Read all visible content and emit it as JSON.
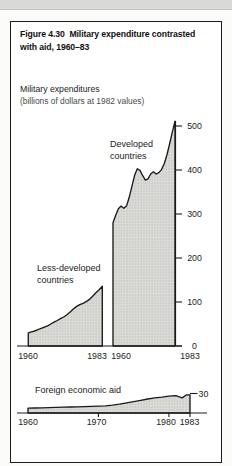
{
  "figure": {
    "title_lines": [
      "Figure 4.30  Military expenditure contrasted",
      "with aid, 1960–83"
    ]
  },
  "colors": {
    "ink": "#1b1b1b",
    "fill_base": "#dcdcd9",
    "fill_dot": "#b7b7b3",
    "top_strip": "#d9d9d5",
    "box_background": "#ffffff"
  },
  "chart_data": [
    {
      "type": "area",
      "title_lines": [
        "Military expenditures",
        "(billions of dollars at 1982 values)"
      ],
      "unit": "billions of dollars at 1982 values",
      "x_range": [
        1960,
        1983
      ],
      "ylim": [
        0,
        520
      ],
      "yticks": [
        0,
        100,
        200,
        300,
        400,
        500
      ],
      "xticklabels": [
        "1960",
        "1983",
        "1960",
        "1983"
      ],
      "grid": false,
      "legend": "labels-inside-plot",
      "series": [
        {
          "id": "less-developed-countries",
          "name": "Less-developed countries",
          "label_lines": [
            "Less-developed",
            "countries"
          ],
          "label_x": 37,
          "label_y": 271,
          "frame": {
            "x0": 28.3,
            "px_per_year": 3.217,
            "base_year": 1960
          },
          "points": [
            [
              1960,
              30
            ],
            [
              1961,
              32
            ],
            [
              1962,
              34
            ],
            [
              1963,
              37
            ],
            [
              1964,
              40
            ],
            [
              1965,
              43
            ],
            [
              1966,
              46
            ],
            [
              1967,
              50
            ],
            [
              1968,
              54
            ],
            [
              1969,
              58
            ],
            [
              1970,
              62
            ],
            [
              1971,
              66
            ],
            [
              1972,
              71
            ],
            [
              1973,
              77
            ],
            [
              1974,
              84
            ],
            [
              1975,
              90
            ],
            [
              1976,
              94
            ],
            [
              1977,
              97
            ],
            [
              1978,
              101
            ],
            [
              1979,
              106
            ],
            [
              1980,
              113
            ],
            [
              1981,
              121
            ],
            [
              1982,
              128
            ],
            [
              1983,
              136
            ]
          ]
        },
        {
          "id": "developed-countries",
          "name": "Developed countries",
          "label_lines": [
            "Developed",
            "countries"
          ],
          "label_x": 110,
          "label_y": 147,
          "frame": {
            "x0": 113,
            "px_per_year": 2.696,
            "base_year": 1960
          },
          "points": [
            [
              1960,
              280
            ],
            [
              1961,
              297
            ],
            [
              1962,
              312
            ],
            [
              1963,
              318
            ],
            [
              1964,
              313
            ],
            [
              1965,
              318
            ],
            [
              1966,
              338
            ],
            [
              1967,
              363
            ],
            [
              1968,
              388
            ],
            [
              1969,
              403
            ],
            [
              1970,
              399
            ],
            [
              1971,
              387
            ],
            [
              1972,
              377
            ],
            [
              1973,
              380
            ],
            [
              1974,
              391
            ],
            [
              1975,
              396
            ],
            [
              1976,
              391
            ],
            [
              1977,
              394
            ],
            [
              1978,
              401
            ],
            [
              1979,
              414
            ],
            [
              1980,
              434
            ],
            [
              1981,
              459
            ],
            [
              1982,
              486
            ],
            [
              1983,
              511
            ]
          ]
        }
      ],
      "layout": {
        "y_base": 346,
        "px_per_unit": 0.44,
        "baseline": [
          17,
          182
        ],
        "yaxis": {
          "line": true,
          "x": 175.5,
          "top": 121,
          "tick_x1": 182,
          "label_x": 194.5
        },
        "xlabel_px": [
          28,
          97,
          121,
          190
        ],
        "xlabel_y": 359
      }
    },
    {
      "type": "area",
      "title_lines": [
        "Foreign economic aid"
      ],
      "unit": "billions of dollars at 1982 values",
      "x_range": [
        1960,
        1983
      ],
      "ylim": [
        0,
        30
      ],
      "yticks": [
        30
      ],
      "xticklabels": [
        "1960",
        "1970",
        "1980",
        "1983"
      ],
      "grid": false,
      "series": [
        {
          "id": "foreign-economic-aid",
          "name": "Foreign economic aid",
          "label_lines": [
            "Foreign economic aid"
          ],
          "label_x": 35,
          "label_y": 392.5,
          "frame": {
            "x0": 28,
            "px_per_year": 7.043,
            "base_year": 1960
          },
          "points": [
            [
              1960,
              7.5
            ],
            [
              1961,
              7.7
            ],
            [
              1962,
              8
            ],
            [
              1963,
              8.3
            ],
            [
              1964,
              8.6
            ],
            [
              1965,
              9
            ],
            [
              1966,
              9.3
            ],
            [
              1967,
              9.6
            ],
            [
              1968,
              9.8
            ],
            [
              1969,
              10.1
            ],
            [
              1970,
              10.5
            ],
            [
              1971,
              11
            ],
            [
              1972,
              12
            ],
            [
              1973,
              13.5
            ],
            [
              1974,
              15.5
            ],
            [
              1975,
              17.5
            ],
            [
              1976,
              19.5
            ],
            [
              1977,
              21.5
            ],
            [
              1978,
              23.3
            ],
            [
              1979,
              24.5
            ],
            [
              1980,
              26
            ],
            [
              1981,
              26.8
            ],
            [
              1981.9,
              23.2
            ],
            [
              1982.5,
              28
            ],
            [
              1983,
              28
            ]
          ]
        }
      ],
      "layout": {
        "y_base": 413,
        "px_per_unit": 0.65,
        "baseline": [
          17,
          207
        ],
        "yaxis": {
          "line": false,
          "tick_x0": 190,
          "tick_x1": 197.5,
          "label_x": 203.5
        },
        "xticks_px": [
          98.4,
          168.9,
          190
        ],
        "xlabel_px": [
          28,
          96.5,
          166,
          189.5
        ],
        "xlabel_y": 425
      }
    }
  ]
}
